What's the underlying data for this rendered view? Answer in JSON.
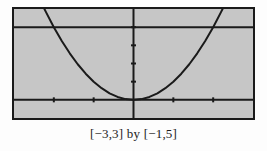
{
  "figure": {
    "caption": "[−3,3] by [−1,5]"
  },
  "chart_data": {
    "type": "line",
    "title": "",
    "xlabel": "",
    "ylabel": "",
    "caption": "[−3,3] by [−1,5]",
    "xlim": [
      -3,
      3
    ],
    "ylim": [
      -1,
      5
    ],
    "x_ticks": [
      -3,
      -2,
      -1,
      0,
      1,
      2,
      3
    ],
    "y_ticks": [
      -1,
      0,
      1,
      2,
      3,
      4,
      5
    ],
    "grid": false,
    "legend_position": "none",
    "plot_bg_color": "#c6c6c6",
    "line_color": "#1a1a1a",
    "axes_visible": true,
    "series": [
      {
        "name": "y = x^2",
        "points": [
          [
            -2.2361,
            5
          ],
          [
            -2.2,
            4.84
          ],
          [
            -2,
            4
          ],
          [
            -1.8,
            3.24
          ],
          [
            -1.6,
            2.56
          ],
          [
            -1.4,
            1.96
          ],
          [
            -1.2,
            1.44
          ],
          [
            -1,
            1
          ],
          [
            -0.8,
            0.64
          ],
          [
            -0.6,
            0.36
          ],
          [
            -0.4,
            0.16
          ],
          [
            -0.2,
            0.04
          ],
          [
            0,
            0
          ],
          [
            0.2,
            0.04
          ],
          [
            0.4,
            0.16
          ],
          [
            0.6,
            0.36
          ],
          [
            0.8,
            0.64
          ],
          [
            1,
            1
          ],
          [
            1.2,
            1.44
          ],
          [
            1.4,
            1.96
          ],
          [
            1.6,
            2.56
          ],
          [
            1.8,
            3.24
          ],
          [
            2,
            4
          ],
          [
            2.2,
            4.84
          ],
          [
            2.2361,
            5
          ]
        ]
      },
      {
        "name": "y = 4",
        "points": [
          [
            -3,
            4
          ],
          [
            3,
            4
          ]
        ]
      }
    ]
  }
}
